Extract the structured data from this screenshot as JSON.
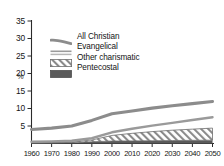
{
  "chart_data": {
    "type": "area",
    "title": "",
    "xlabel": "",
    "ylabel": "%",
    "x": [
      1960,
      1970,
      1980,
      1990,
      2000,
      2010,
      2020,
      2030,
      2040,
      2050
    ],
    "xtick_labels": [
      "1960",
      "1970",
      "1980",
      "1990",
      "2000",
      "2010",
      "2020",
      "2030",
      "2040",
      "2050"
    ],
    "ytick_labels": [
      "35",
      "30",
      "25",
      "20",
      "15",
      "10",
      "5"
    ],
    "ytick_values": [
      35,
      30,
      25,
      20,
      15,
      10,
      5
    ],
    "ylim": [
      0,
      36
    ],
    "xlim": [
      1960,
      2050
    ],
    "grid": false,
    "legend_position": "upper-left",
    "series": [
      {
        "name": "All Christian",
        "style": "line",
        "color": "#8c8c8c",
        "values": [
          4.0,
          4.4,
          5.0,
          6.6,
          8.5,
          9.3,
          10.1,
          10.8,
          11.4,
          12.0
        ]
      },
      {
        "name": "Evangelical",
        "style": "line",
        "color": "#9a9a9a",
        "values": [
          0.5,
          0.6,
          0.8,
          1.5,
          3.2,
          4.2,
          5.1,
          5.9,
          6.7,
          7.5
        ]
      },
      {
        "name": "Other charismatic",
        "style": "hatched-area",
        "color": "#6e6e6e",
        "values": [
          0.2,
          0.25,
          0.4,
          1.0,
          2.3,
          2.9,
          3.4,
          3.8,
          4.1,
          4.4
        ]
      },
      {
        "name": "Pentecostal",
        "style": "filled-area",
        "color": "#5a5a5a",
        "values": [
          0.15,
          0.2,
          0.3,
          0.5,
          0.7,
          0.75,
          0.8,
          0.85,
          0.9,
          0.95
        ]
      }
    ]
  },
  "legend": {
    "items": [
      {
        "label": "All Christian",
        "swatch": "thick-line-swatch"
      },
      {
        "label": "Evangelical",
        "swatch": "thin-lines-swatch"
      },
      {
        "label": "Other charismatic",
        "swatch": "hatch-swatch"
      },
      {
        "label": "Pentecostal",
        "swatch": "solid-fill-swatch"
      }
    ]
  },
  "axes": {
    "y_unit_label": "%",
    "y_labels": [
      "35",
      "30",
      "25",
      "20",
      "15",
      "10",
      "5"
    ],
    "x_labels": [
      "1960",
      "1970",
      "1980",
      "1990",
      "2000",
      "2010",
      "2020",
      "2030",
      "2040",
      "2050"
    ]
  },
  "colors": {
    "all_christian": "#8c8c8c",
    "evangelical": "#9a9a9a",
    "other_charismatic": "#6e6e6e",
    "pentecostal": "#5a5a5a",
    "axis": "#2b2b2b",
    "text": "#141414"
  }
}
